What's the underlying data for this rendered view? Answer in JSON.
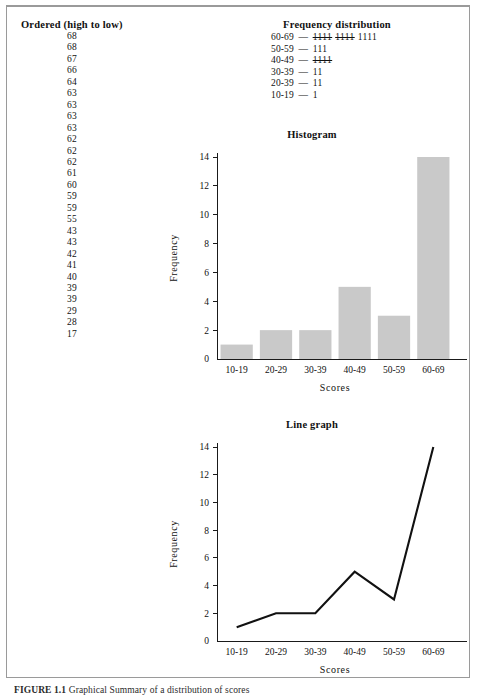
{
  "ordered": {
    "title": "Ordered (high to low)",
    "values": [
      68,
      68,
      67,
      66,
      64,
      63,
      63,
      63,
      63,
      62,
      62,
      62,
      61,
      60,
      59,
      59,
      55,
      43,
      43,
      42,
      41,
      40,
      39,
      39,
      29,
      28,
      17
    ]
  },
  "frequency_distribution": {
    "title": "Frequency distribution",
    "dash": "—",
    "rows": [
      {
        "bin": "60-69",
        "tally_groups": [
          "1111",
          "1111"
        ],
        "tally_rest": "1111",
        "count": 14
      },
      {
        "bin": "50-59",
        "tally_groups": [],
        "tally_rest": "111",
        "count": 3
      },
      {
        "bin": "40-49",
        "tally_groups": [
          "1111"
        ],
        "tally_rest": "",
        "count": 5
      },
      {
        "bin": "30-39",
        "tally_groups": [],
        "tally_rest": "11",
        "count": 2
      },
      {
        "bin": "20-39",
        "tally_groups": [],
        "tally_rest": "11",
        "count": 2
      },
      {
        "bin": "10-19",
        "tally_groups": [],
        "tally_rest": "1",
        "count": 1
      }
    ]
  },
  "caption": {
    "label": "FIGURE 1.1",
    "text": "Graphical Summary of a distribution of scores"
  },
  "colors": {
    "bar_fill": "#c9c9c9",
    "axis": "#1a1a1a",
    "line": "#111111",
    "frame": "#9a9a9a"
  },
  "chart_data": [
    {
      "type": "bar",
      "title": "Histogram",
      "categories": [
        "10-19",
        "20-29",
        "30-39",
        "40-49",
        "50-59",
        "60-69"
      ],
      "values": [
        1,
        2,
        2,
        5,
        3,
        14
      ],
      "xlabel": "Scores",
      "ylabel": "Frequency",
      "ylim": [
        0,
        14
      ],
      "yticks": [
        0,
        2,
        4,
        6,
        8,
        10,
        12,
        14
      ],
      "grid": false,
      "legend": "none"
    },
    {
      "type": "line",
      "title": "Line graph",
      "categories": [
        "10-19",
        "20-29",
        "30-39",
        "40-49",
        "50-59",
        "60-69"
      ],
      "values": [
        1,
        2,
        2,
        5,
        3,
        14
      ],
      "xlabel": "Scores",
      "ylabel": "Frequency",
      "ylim": [
        0,
        14
      ],
      "yticks": [
        0,
        2,
        4,
        6,
        8,
        10,
        12,
        14
      ],
      "grid": false,
      "legend": "none"
    }
  ]
}
